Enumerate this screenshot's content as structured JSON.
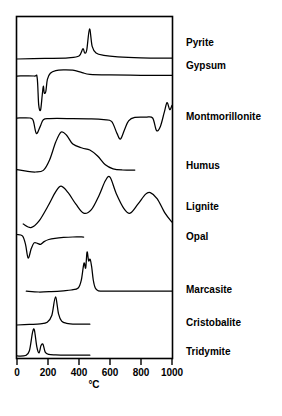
{
  "figure": {
    "type": "dta-thermogram-panel",
    "axis": {
      "xlabel": "°C",
      "ticks": [
        "0",
        "200",
        "400",
        "600",
        "800",
        "1000"
      ],
      "xmin": 0,
      "xmax": 1000
    },
    "labels": [
      {
        "name": "pyrite",
        "text": "Pyrite"
      },
      {
        "name": "gypsum",
        "text": "Gypsum"
      },
      {
        "name": "montmorillonite",
        "text": "Montmorillonite"
      },
      {
        "name": "humus",
        "text": "Humus"
      },
      {
        "name": "lignite",
        "text": "Lignite"
      },
      {
        "name": "opal",
        "text": "Opal"
      },
      {
        "name": "marcasite",
        "text": "Marcasite"
      },
      {
        "name": "cristobalite",
        "text": "Cristobalite"
      },
      {
        "name": "tridymite",
        "text": "Tridymite"
      }
    ]
  },
  "chart_data": {
    "type": "line",
    "title": "",
    "xlabel": "°C",
    "ylabel": "",
    "xlim": [
      0,
      1000
    ],
    "grid": false,
    "legend": "right-labels",
    "line_color": "#000000",
    "note": "Differential thermal analysis (DTA) curves; upward deflection = exothermic, downward = endothermic. Each trace is offset vertically on a shared temperature axis.",
    "series": [
      {
        "name": "Pyrite",
        "features": [
          {
            "kind": "exotherm",
            "temperature": 430,
            "relative_height": 0.35,
            "note": "shoulder peak"
          },
          {
            "kind": "exotherm",
            "temperature": 470,
            "relative_height": 1.0,
            "note": "main sharp peak"
          }
        ],
        "x_start": 0,
        "x_end": 1000,
        "points": [
          [
            0,
            0
          ],
          [
            180,
            0.02
          ],
          [
            330,
            0.04
          ],
          [
            400,
            0.1
          ],
          [
            425,
            0.34
          ],
          [
            437,
            0.2
          ],
          [
            450,
            0.3
          ],
          [
            468,
            1.0
          ],
          [
            485,
            0.42
          ],
          [
            510,
            0.2
          ],
          [
            560,
            0.12
          ],
          [
            650,
            0.07
          ],
          [
            800,
            0.04
          ],
          [
            1000,
            0.03
          ]
        ]
      },
      {
        "name": "Gypsum",
        "features": [
          {
            "kind": "endotherm",
            "temperature": 150,
            "relative_depth": 1.0,
            "note": "deep narrow dehydration endotherm"
          },
          {
            "kind": "endotherm",
            "temperature": 185,
            "relative_depth": 0.45,
            "note": "secondary notch"
          },
          {
            "kind": "exotherm",
            "temperature": 370,
            "relative_height": 0.18,
            "note": "broad low bump"
          }
        ],
        "x_start": 0,
        "x_end": 1000,
        "points": [
          [
            0,
            0
          ],
          [
            110,
            0.0
          ],
          [
            130,
            -0.05
          ],
          [
            140,
            -0.85
          ],
          [
            152,
            -1.0
          ],
          [
            163,
            -0.55
          ],
          [
            170,
            -0.3
          ],
          [
            176,
            -0.5
          ],
          [
            186,
            -0.45
          ],
          [
            196,
            -0.1
          ],
          [
            215,
            0.08
          ],
          [
            250,
            0.16
          ],
          [
            300,
            0.18
          ],
          [
            360,
            0.17
          ],
          [
            420,
            0.1
          ],
          [
            470,
            0.05
          ],
          [
            600,
            0.03
          ],
          [
            800,
            0.02
          ],
          [
            1000,
            0.02
          ]
        ]
      },
      {
        "name": "Montmorillonite",
        "features": [
          {
            "kind": "endotherm",
            "temperature": 130,
            "relative_depth": 0.55
          },
          {
            "kind": "endotherm",
            "temperature": 670,
            "relative_depth": 0.75
          },
          {
            "kind": "endotherm",
            "temperature": 900,
            "relative_depth": 0.45
          },
          {
            "kind": "exotherm",
            "temperature": 980,
            "relative_height": 0.6,
            "note": "sharp terminal exotherm"
          }
        ],
        "x_start": 0,
        "x_end": 1000,
        "points": [
          [
            0,
            0
          ],
          [
            85,
            0.0
          ],
          [
            105,
            -0.1
          ],
          [
            125,
            -0.55
          ],
          [
            150,
            -0.3
          ],
          [
            170,
            -0.06
          ],
          [
            210,
            -0.02
          ],
          [
            350,
            -0.02
          ],
          [
            480,
            -0.03
          ],
          [
            560,
            -0.06
          ],
          [
            610,
            -0.12
          ],
          [
            645,
            -0.55
          ],
          [
            668,
            -0.75
          ],
          [
            695,
            -0.4
          ],
          [
            720,
            -0.1
          ],
          [
            760,
            0.02
          ],
          [
            830,
            0.03
          ],
          [
            875,
            0.0
          ],
          [
            900,
            -0.45
          ],
          [
            925,
            -0.3
          ],
          [
            950,
            0.2
          ],
          [
            968,
            0.55
          ],
          [
            985,
            0.3
          ],
          [
            1000,
            0.45
          ]
        ]
      },
      {
        "name": "Humus",
        "features": [
          {
            "kind": "exotherm",
            "temperature": 300,
            "relative_height": 1.0,
            "note": "broad combustion exotherm"
          },
          {
            "kind": "exotherm",
            "temperature": 450,
            "relative_height": 0.55,
            "note": "shoulder"
          }
        ],
        "x_start": 0,
        "x_end": 760,
        "points": [
          [
            0,
            0.06
          ],
          [
            60,
            0.02
          ],
          [
            120,
            0.0
          ],
          [
            170,
            0.04
          ],
          [
            210,
            0.3
          ],
          [
            250,
            0.75
          ],
          [
            285,
            1.0
          ],
          [
            320,
            0.92
          ],
          [
            360,
            0.7
          ],
          [
            420,
            0.6
          ],
          [
            470,
            0.55
          ],
          [
            520,
            0.4
          ],
          [
            570,
            0.18
          ],
          [
            620,
            0.08
          ],
          [
            680,
            0.05
          ],
          [
            760,
            0.05
          ]
        ]
      },
      {
        "name": "Lignite",
        "features": [
          {
            "kind": "exotherm",
            "temperature": 280,
            "relative_height": 0.8,
            "note": "first broad exotherm, clipped at panel top"
          },
          {
            "kind": "exotherm",
            "temperature": 590,
            "relative_height": 1.0,
            "note": "peak runs off top of trace band"
          },
          {
            "kind": "exotherm",
            "temperature": 850,
            "relative_height": 0.62
          }
        ],
        "x_start": 40,
        "x_end": 1000,
        "points": [
          [
            40,
            -0.25
          ],
          [
            90,
            -0.35
          ],
          [
            140,
            -0.18
          ],
          [
            200,
            0.25
          ],
          [
            250,
            0.65
          ],
          [
            285,
            0.8
          ],
          [
            330,
            0.62
          ],
          [
            380,
            0.3
          ],
          [
            430,
            0.05
          ],
          [
            480,
            0.15
          ],
          [
            530,
            0.55
          ],
          [
            570,
            0.95
          ],
          [
            600,
            1.05
          ],
          [
            640,
            0.6
          ],
          [
            690,
            0.18
          ],
          [
            730,
            0.05
          ],
          [
            780,
            0.3
          ],
          [
            830,
            0.58
          ],
          [
            860,
            0.62
          ],
          [
            905,
            0.45
          ],
          [
            955,
            0.05
          ],
          [
            1000,
            -0.2
          ]
        ]
      },
      {
        "name": "Opal",
        "features": [
          {
            "kind": "endotherm",
            "temperature": 80,
            "relative_depth": 1.0,
            "note": "sharp dehydration endotherm"
          },
          {
            "kind": "endotherm",
            "temperature": 150,
            "relative_depth": 0.35,
            "note": "small secondary dip"
          }
        ],
        "x_start": 0,
        "x_end": 430,
        "points": [
          [
            0,
            0.12
          ],
          [
            35,
            0.05
          ],
          [
            55,
            -0.35
          ],
          [
            72,
            -1.0
          ],
          [
            92,
            -0.55
          ],
          [
            110,
            -0.28
          ],
          [
            132,
            -0.3
          ],
          [
            152,
            -0.35
          ],
          [
            175,
            -0.22
          ],
          [
            205,
            -0.12
          ],
          [
            245,
            -0.06
          ],
          [
            300,
            -0.02
          ],
          [
            360,
            0.0
          ],
          [
            430,
            0.0
          ]
        ]
      },
      {
        "name": "Marcasite",
        "features": [
          {
            "kind": "exotherm",
            "temperature": 455,
            "relative_height": 1.0,
            "note": "tall sharp oxidation exotherm with notched crest"
          },
          {
            "kind": "exotherm",
            "temperature": 480,
            "relative_height": 0.8
          }
        ],
        "x_start": 60,
        "x_end": 1000,
        "points": [
          [
            60,
            0.02
          ],
          [
            140,
            0.0
          ],
          [
            220,
            0.01
          ],
          [
            300,
            0.03
          ],
          [
            350,
            0.05
          ],
          [
            395,
            0.1
          ],
          [
            415,
            0.3
          ],
          [
            432,
            0.72
          ],
          [
            443,
            0.6
          ],
          [
            452,
            1.0
          ],
          [
            462,
            0.78
          ],
          [
            472,
            0.82
          ],
          [
            482,
            0.62
          ],
          [
            492,
            0.3
          ],
          [
            505,
            0.1
          ],
          [
            525,
            0.03
          ],
          [
            580,
            0.02
          ],
          [
            700,
            0.02
          ],
          [
            850,
            0.02
          ],
          [
            1000,
            0.02
          ]
        ]
      },
      {
        "name": "Cristobalite",
        "features": [
          {
            "kind": "exotherm",
            "temperature": 250,
            "relative_height": 1.0,
            "note": "single sharp inversion peak"
          }
        ],
        "x_start": 0,
        "x_end": 470,
        "points": [
          [
            0,
            0.0
          ],
          [
            80,
            0.02
          ],
          [
            150,
            0.04
          ],
          [
            195,
            0.1
          ],
          [
            225,
            0.35
          ],
          [
            248,
            1.0
          ],
          [
            268,
            0.4
          ],
          [
            288,
            0.14
          ],
          [
            320,
            0.06
          ],
          [
            380,
            0.03
          ],
          [
            470,
            0.03
          ]
        ]
      },
      {
        "name": "Tridymite",
        "features": [
          {
            "kind": "exotherm",
            "temperature": 110,
            "relative_height": 1.0
          },
          {
            "kind": "exotherm",
            "temperature": 165,
            "relative_height": 0.45
          }
        ],
        "x_start": 0,
        "x_end": 470,
        "points": [
          [
            0,
            0.0
          ],
          [
            55,
            0.02
          ],
          [
            80,
            0.2
          ],
          [
            100,
            0.9
          ],
          [
            112,
            1.0
          ],
          [
            128,
            0.35
          ],
          [
            142,
            0.12
          ],
          [
            155,
            0.4
          ],
          [
            168,
            0.45
          ],
          [
            182,
            0.15
          ],
          [
            205,
            0.06
          ],
          [
            250,
            0.04
          ],
          [
            320,
            0.03
          ],
          [
            400,
            0.03
          ],
          [
            470,
            0.03
          ]
        ]
      }
    ]
  }
}
